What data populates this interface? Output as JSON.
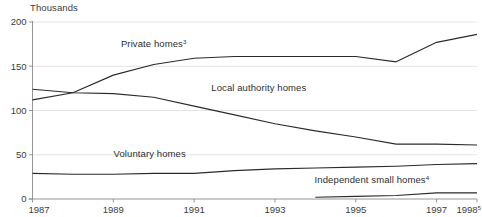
{
  "chart_data": {
    "type": "line",
    "title": "",
    "subtitle": "",
    "unit_label": "Thousands",
    "xlabel": "",
    "ylabel": "",
    "grid": true,
    "legend_position": "inline-labels",
    "xlim": [
      1987,
      1998
    ],
    "ylim": [
      0,
      200
    ],
    "x_ticks": [
      "1987",
      "1989",
      "1991",
      "1993",
      "1995",
      "1997",
      "1998"
    ],
    "x_tick_values": [
      1987,
      1989,
      1991,
      1993,
      1995,
      1997,
      1998
    ],
    "x_tick_superscripts": [
      "",
      "",
      "",
      "",
      "",
      "",
      "5"
    ],
    "y_ticks": [
      "0",
      "50",
      "100",
      "150",
      "200"
    ],
    "y_tick_values": [
      0,
      50,
      100,
      150,
      200
    ],
    "x": [
      1987,
      1988,
      1989,
      1990,
      1991,
      1992,
      1993,
      1994,
      1995,
      1996,
      1997,
      1998
    ],
    "series": [
      {
        "name": "Private homes",
        "superscript": "3",
        "label_x": 1990.0,
        "label_y": 172,
        "values": [
          112,
          120,
          140,
          152,
          159,
          161,
          161,
          161,
          161,
          155,
          177,
          186
        ]
      },
      {
        "name": "Local authority homes",
        "superscript": "",
        "label_x": 1992.6,
        "label_y": 122,
        "values": [
          124,
          120,
          119,
          115,
          105,
          95,
          85,
          77,
          70,
          62,
          62,
          61
        ]
      },
      {
        "name": "Voluntary homes",
        "superscript": "",
        "label_x": 1989.9,
        "label_y": 48,
        "values": [
          29,
          28,
          28,
          29,
          29,
          32,
          34,
          35,
          36,
          37,
          39,
          40
        ]
      },
      {
        "name": "Independent small homes",
        "superscript": "4",
        "label_x": 1995.4,
        "label_y": 18,
        "values": [
          null,
          null,
          null,
          null,
          null,
          null,
          null,
          2,
          3,
          4,
          7,
          7
        ]
      }
    ]
  }
}
